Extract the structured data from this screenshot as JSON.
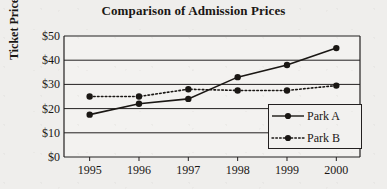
{
  "chart_data": {
    "type": "line",
    "title": "Comparison of Admission Prices",
    "xlabel": "",
    "ylabel": "Ticket Price",
    "categories": [
      "1995",
      "1996",
      "1997",
      "1998",
      "1999",
      "2000"
    ],
    "x": [
      1995,
      1996,
      1997,
      1998,
      1999,
      2000
    ],
    "series": [
      {
        "name": "Park A",
        "values": [
          17.5,
          22,
          24,
          33,
          38,
          45
        ],
        "line_style": "solid",
        "marker": "filled-circle",
        "color": "#1a1714"
      },
      {
        "name": "Park B",
        "values": [
          25,
          25,
          28,
          27.5,
          27.5,
          29.5
        ],
        "line_style": "dotted",
        "marker": "filled-circle",
        "color": "#1a1714"
      }
    ],
    "ylim": [
      0,
      50
    ],
    "ytick_values": [
      0,
      10,
      20,
      30,
      40,
      50
    ],
    "ytick_labels": [
      "$0",
      "$10",
      "$20",
      "$30",
      "$40",
      "$50"
    ],
    "xtick_labels": [
      "1995",
      "1996",
      "1997",
      "1998",
      "1999",
      "2000"
    ],
    "grid": "horizontal",
    "legend_position": "lower-right",
    "legend_entries": [
      "Park A",
      "Park B"
    ],
    "background_color": "#efeeec",
    "axis_color": "#232020"
  },
  "legend": {
    "park_a_label": "Park A",
    "park_b_label": "Park B"
  }
}
